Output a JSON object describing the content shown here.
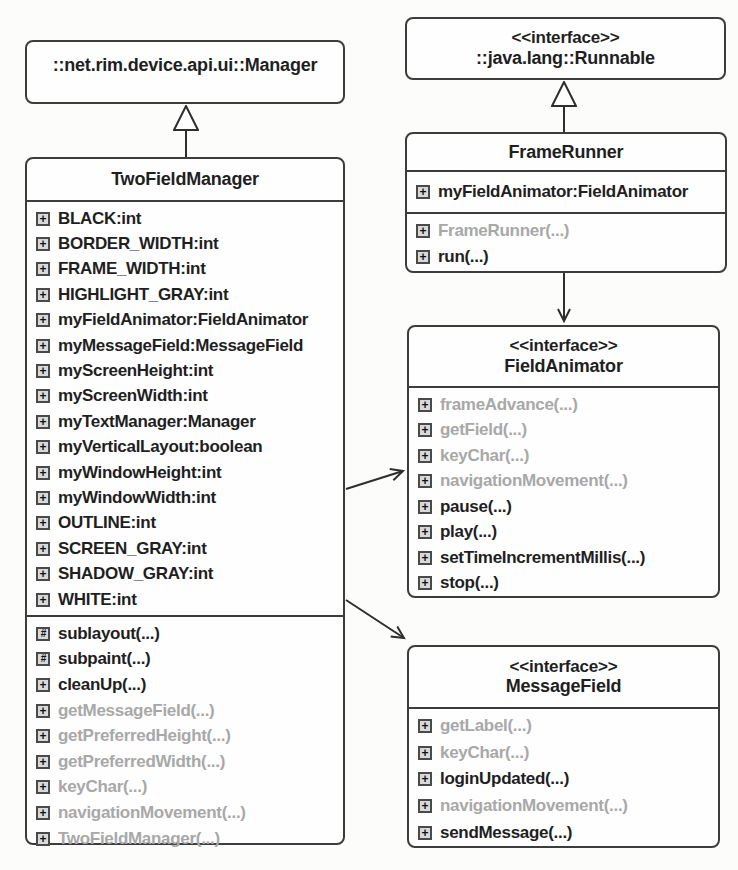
{
  "icons": {
    "plus_glyph": "+",
    "hash_glyph": "#"
  },
  "colors": {
    "ink": "#1f1f1f",
    "muted_text": "#a8a8a8",
    "box_border": "#3c3c3c",
    "box_fill": "#fefefe",
    "background": "#fcfcfb",
    "icon_fill": "#d9d9d9"
  },
  "classes": {
    "manager": {
      "title": "::net.rim.device.api.ui::Manager"
    },
    "runnable": {
      "stereotype": "<<interface>>",
      "title": "::java.lang::Runnable"
    },
    "twoFieldManager": {
      "title": "TwoFieldManager",
      "attributes": [
        {
          "icon": "plus-box",
          "label": "BLACK:int",
          "muted": false
        },
        {
          "icon": "plus-box",
          "label": "BORDER_WIDTH:int",
          "muted": false
        },
        {
          "icon": "plus-box",
          "label": "FRAME_WIDTH:int",
          "muted": false
        },
        {
          "icon": "plus-box",
          "label": "HIGHLIGHT_GRAY:int",
          "muted": false
        },
        {
          "icon": "plus-box",
          "label": "myFieldAnimator:FieldAnimator",
          "muted": false
        },
        {
          "icon": "plus-box",
          "label": "myMessageField:MessageField",
          "muted": false
        },
        {
          "icon": "plus-box",
          "label": "myScreenHeight:int",
          "muted": false
        },
        {
          "icon": "plus-box",
          "label": "myScreenWidth:int",
          "muted": false
        },
        {
          "icon": "plus-box",
          "label": "myTextManager:Manager",
          "muted": false
        },
        {
          "icon": "plus-box",
          "label": "myVerticalLayout:boolean",
          "muted": false
        },
        {
          "icon": "plus-box",
          "label": "myWindowHeight:int",
          "muted": false
        },
        {
          "icon": "plus-box",
          "label": "myWindowWidth:int",
          "muted": false
        },
        {
          "icon": "plus-box",
          "label": "OUTLINE:int",
          "muted": false
        },
        {
          "icon": "plus-box",
          "label": "SCREEN_GRAY:int",
          "muted": false
        },
        {
          "icon": "plus-box",
          "label": "SHADOW_GRAY:int",
          "muted": false
        },
        {
          "icon": "plus-box",
          "label": "WHITE:int",
          "muted": false
        }
      ],
      "methods": [
        {
          "icon": "hash-box",
          "label": "sublayout(...)",
          "muted": false
        },
        {
          "icon": "hash-box",
          "label": "subpaint(...)",
          "muted": false
        },
        {
          "icon": "plus-box",
          "label": "cleanUp(...)",
          "muted": false
        },
        {
          "icon": "plus-box",
          "label": "getMessageField(...)",
          "muted": true
        },
        {
          "icon": "plus-box",
          "label": "getPreferredHeight(...)",
          "muted": true
        },
        {
          "icon": "plus-box",
          "label": "getPreferredWidth(...)",
          "muted": true
        },
        {
          "icon": "plus-box",
          "label": "keyChar(...)",
          "muted": true
        },
        {
          "icon": "plus-box",
          "label": "navigationMovement(...)",
          "muted": true
        },
        {
          "icon": "plus-box",
          "label": "TwoFieldManager(...)",
          "muted": true
        }
      ]
    },
    "frameRunner": {
      "title": "FrameRunner",
      "attributes": [
        {
          "icon": "plus-box",
          "label": "myFieldAnimator:FieldAnimator",
          "muted": false
        }
      ],
      "methods": [
        {
          "icon": "plus-box",
          "label": "FrameRunner(...)",
          "muted": true
        },
        {
          "icon": "plus-box",
          "label": "run(...)",
          "muted": false
        }
      ]
    },
    "fieldAnimator": {
      "stereotype": "<<interface>>",
      "title": "FieldAnimator",
      "methods": [
        {
          "icon": "plus-box",
          "label": "frameAdvance(...)",
          "muted": true
        },
        {
          "icon": "plus-box",
          "label": "getField(...)",
          "muted": true
        },
        {
          "icon": "plus-box",
          "label": "keyChar(...)",
          "muted": true
        },
        {
          "icon": "plus-box",
          "label": "navigationMovement(...)",
          "muted": true
        },
        {
          "icon": "plus-box",
          "label": "pause(...)",
          "muted": false
        },
        {
          "icon": "plus-box",
          "label": "play(...)",
          "muted": false
        },
        {
          "icon": "plus-box",
          "label": "setTimeIncrementMillis(...)",
          "muted": false
        },
        {
          "icon": "plus-box",
          "label": "stop(...)",
          "muted": false
        }
      ]
    },
    "messageField": {
      "stereotype": "<<interface>>",
      "title": "MessageField",
      "methods": [
        {
          "icon": "plus-box",
          "label": "getLabel(...)",
          "muted": true
        },
        {
          "icon": "plus-box",
          "label": "keyChar(...)",
          "muted": true
        },
        {
          "icon": "plus-box",
          "label": "loginUpdated(...)",
          "muted": false
        },
        {
          "icon": "plus-box",
          "label": "navigationMovement(...)",
          "muted": true
        },
        {
          "icon": "plus-box",
          "label": "sendMessage(...)",
          "muted": false
        }
      ]
    }
  },
  "relationships": [
    {
      "type": "generalization",
      "from": "TwoFieldManager",
      "to": "::net.rim.device.api.ui::Manager"
    },
    {
      "type": "generalization",
      "from": "FrameRunner",
      "to": "::java.lang::Runnable"
    },
    {
      "type": "association",
      "from": "FrameRunner",
      "to": "FieldAnimator"
    },
    {
      "type": "association",
      "from": "TwoFieldManager",
      "to": "FieldAnimator"
    },
    {
      "type": "association",
      "from": "TwoFieldManager",
      "to": "MessageField"
    }
  ]
}
